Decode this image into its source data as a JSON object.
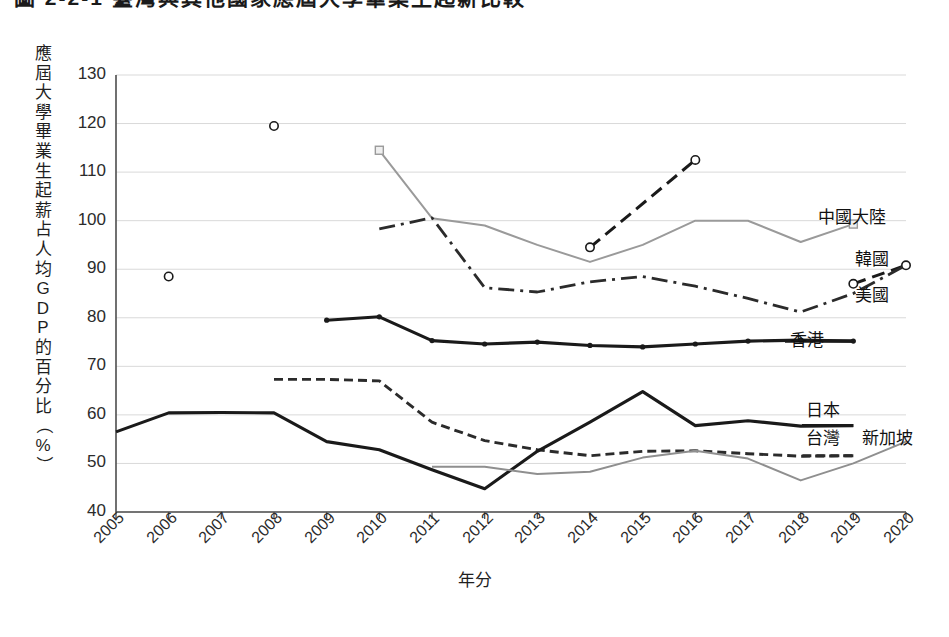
{
  "figure": {
    "title": "圖 2-2-1  臺灣與其他國家應屆大學畢業生起薪比較",
    "title_clipped": true
  },
  "axes": {
    "ylabel": "應屆大學畢業生起薪占人均GDP的百分比（%）",
    "ylabel_chars": [
      "應",
      "屆",
      "大",
      "學",
      "畢",
      "業",
      "生",
      "起",
      "薪",
      "占",
      "人",
      "均",
      "G",
      "D",
      "P",
      "的",
      "百",
      "分",
      "比",
      "（",
      "%",
      "）"
    ],
    "xlabel": "年分",
    "yticks": [
      "130",
      "120",
      "110",
      "100",
      "90",
      "80",
      "70",
      "60",
      "50",
      "40"
    ],
    "xticks": [
      "2005",
      "2006",
      "2007",
      "2008",
      "2009",
      "2010",
      "2011",
      "2012",
      "2013",
      "2014",
      "2015",
      "2016",
      "2017",
      "2018",
      "2019",
      "2020"
    ]
  },
  "colors": {
    "dark": "#1a1a1a",
    "gray": "#9a9a9a",
    "axis": "#4d4d4d",
    "grid": "#d9d9d9",
    "text": "#2b2b2b"
  },
  "chart_data": {
    "type": "line",
    "title": "圖 2-2-1  臺灣與其他國家應屆大學畢業生起薪比較",
    "xlabel": "年分",
    "ylabel": "應屆大學畢業生起薪占人均GDP的百分比（%）",
    "x": [
      2005,
      2006,
      2007,
      2008,
      2009,
      2010,
      2011,
      2012,
      2013,
      2014,
      2015,
      2016,
      2017,
      2018,
      2019,
      2020
    ],
    "xlim": [
      2005,
      2020
    ],
    "ylim": [
      40,
      130
    ],
    "ytick_step": 10,
    "grid": "horizontal",
    "legend": "inline-right-of-line-ends",
    "series": [
      {
        "name": "中國大陸",
        "label": "中國大陸",
        "color": "#9a9a9a",
        "style": "solid-light",
        "marker": "square-open",
        "marker_years": [
          2010,
          2019
        ],
        "points": [
          {
            "x": 2010,
            "y": 114.5
          },
          {
            "x": 2011,
            "y": 100.5
          },
          {
            "x": 2012,
            "y": 99.0
          },
          {
            "x": 2013,
            "y": 95.0
          },
          {
            "x": 2014,
            "y": 91.5
          },
          {
            "x": 2015,
            "y": 95.0
          },
          {
            "x": 2016,
            "y": 100.0
          },
          {
            "x": 2017,
            "y": 100.0
          },
          {
            "x": 2018,
            "y": 95.6
          },
          {
            "x": 2019,
            "y": 99.3
          }
        ]
      },
      {
        "name": "韓國",
        "label": "韓國",
        "color": "#1a1a1a",
        "style": "dashed",
        "marker": "circle-open",
        "marker_years": [
          2006,
          2008,
          2014,
          2016,
          2019,
          2020
        ],
        "isolated_points": [
          {
            "x": 2006,
            "y": 88.5
          },
          {
            "x": 2008,
            "y": 119.5
          }
        ],
        "segments": [
          [
            {
              "x": 2014,
              "y": 94.5
            },
            {
              "x": 2016,
              "y": 112.5
            }
          ],
          [
            {
              "x": 2019,
              "y": 87.0
            },
            {
              "x": 2020,
              "y": 90.8
            }
          ]
        ]
      },
      {
        "name": "美國",
        "label": "美國",
        "color": "#2b2b2b",
        "style": "dash-dot",
        "marker": "none",
        "points": [
          {
            "x": 2010,
            "y": 98.3
          },
          {
            "x": 2011,
            "y": 100.6
          },
          {
            "x": 2012,
            "y": 86.2
          },
          {
            "x": 2013,
            "y": 85.3
          },
          {
            "x": 2014,
            "y": 87.4
          },
          {
            "x": 2015,
            "y": 88.5
          },
          {
            "x": 2016,
            "y": 86.5
          },
          {
            "x": 2017,
            "y": 84.0
          },
          {
            "x": 2018,
            "y": 81.2
          },
          {
            "x": 2019,
            "y": 85.0
          },
          {
            "x": 2020,
            "y": 90.8
          }
        ]
      },
      {
        "name": "香港",
        "label": "香港",
        "color": "#1a1a1a",
        "style": "solid-thick",
        "marker": "dot-filled",
        "points": [
          {
            "x": 2009,
            "y": 79.5
          },
          {
            "x": 2010,
            "y": 80.2
          },
          {
            "x": 2011,
            "y": 75.3
          },
          {
            "x": 2012,
            "y": 74.6
          },
          {
            "x": 2013,
            "y": 75.0
          },
          {
            "x": 2014,
            "y": 74.3
          },
          {
            "x": 2015,
            "y": 74.0
          },
          {
            "x": 2016,
            "y": 74.6
          },
          {
            "x": 2017,
            "y": 75.2
          },
          {
            "x": 2018,
            "y": 75.4
          },
          {
            "x": 2019,
            "y": 75.2
          }
        ]
      },
      {
        "name": "日本",
        "label": "日本",
        "color": "#2b2b2b",
        "style": "dotted-dash",
        "marker": "none",
        "points": [
          {
            "x": 2008,
            "y": 67.3
          },
          {
            "x": 2009,
            "y": 67.3
          },
          {
            "x": 2010,
            "y": 67.0
          },
          {
            "x": 2011,
            "y": 58.5
          },
          {
            "x": 2012,
            "y": 54.7
          },
          {
            "x": 2013,
            "y": 52.8
          },
          {
            "x": 2014,
            "y": 51.6
          },
          {
            "x": 2015,
            "y": 52.5
          },
          {
            "x": 2016,
            "y": 52.6
          },
          {
            "x": 2017,
            "y": 52.0
          },
          {
            "x": 2018,
            "y": 51.5
          },
          {
            "x": 2019,
            "y": 51.6
          }
        ]
      },
      {
        "name": "台灣",
        "label": "台灣",
        "color": "#1a1a1a",
        "style": "solid-thick",
        "marker": "none",
        "points": [
          {
            "x": 2005,
            "y": 56.5
          },
          {
            "x": 2006,
            "y": 60.4
          },
          {
            "x": 2007,
            "y": 60.5
          },
          {
            "x": 2008,
            "y": 60.4
          },
          {
            "x": 2009,
            "y": 54.5
          },
          {
            "x": 2010,
            "y": 52.8
          },
          {
            "x": 2011,
            "y": 48.7
          },
          {
            "x": 2012,
            "y": 44.8
          },
          {
            "x": 2013,
            "y": 52.5
          },
          {
            "x": 2014,
            "y": 58.5
          },
          {
            "x": 2015,
            "y": 64.8
          },
          {
            "x": 2016,
            "y": 57.8
          },
          {
            "x": 2017,
            "y": 58.8
          },
          {
            "x": 2018,
            "y": 57.7
          },
          {
            "x": 2019,
            "y": 57.8
          }
        ]
      },
      {
        "name": "新加坡",
        "label": "新加坡",
        "color": "#8f8f8f",
        "style": "solid-light",
        "marker": "none",
        "points": [
          {
            "x": 2011,
            "y": 49.3
          },
          {
            "x": 2012,
            "y": 49.3
          },
          {
            "x": 2013,
            "y": 47.8
          },
          {
            "x": 2014,
            "y": 48.3
          },
          {
            "x": 2015,
            "y": 51.2
          },
          {
            "x": 2016,
            "y": 52.6
          },
          {
            "x": 2017,
            "y": 51.0
          },
          {
            "x": 2018,
            "y": 46.5
          },
          {
            "x": 2019,
            "y": 50.0
          },
          {
            "x": 2020,
            "y": 54.5
          }
        ]
      }
    ]
  }
}
